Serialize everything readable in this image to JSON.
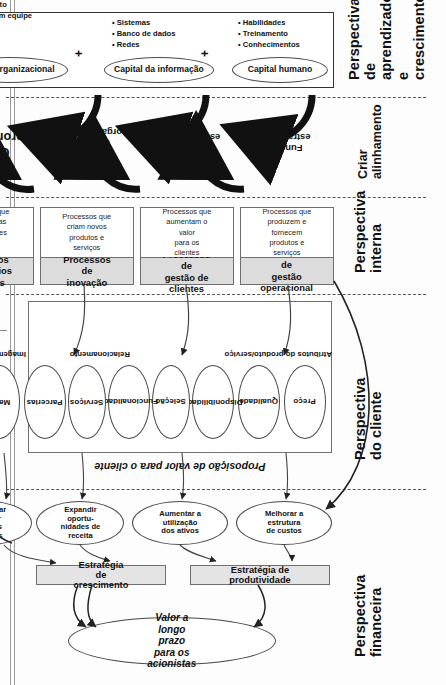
{
  "document": {
    "type": "balanced-scorecard-strategy-map",
    "language": "pt-BR"
  },
  "perspectives": [
    {
      "id": "financeira",
      "label": "Perspectiva\nfinanceira",
      "line1": "Perspectiva",
      "line2": "financeira"
    },
    {
      "id": "cliente",
      "label": "Perspectiva do cliente",
      "line1": "Perspectiva",
      "line2": "do cliente"
    },
    {
      "id": "interna",
      "label": "Perspectiva interna",
      "line1": "Perspectiva",
      "line2": "interna"
    },
    {
      "id": "alinhamento",
      "label": "Criar alinhamento",
      "line1": "Criar",
      "line2": "alinhamento"
    },
    {
      "id": "aprendizado",
      "label": "Perspectiva de aprendizado e crescimento",
      "line1": "Perspectiva de",
      "line2": "aprendizado",
      "line3": "e crescimento"
    }
  ],
  "financial": {
    "goal_oval": "Valor a longo prazo para os acionistas",
    "strategy_growth": "Estratégia de crescimento",
    "strategy_productivity": "Estratégia de produtividade",
    "objectives": [
      {
        "id": "melhorar-custos",
        "line1": "Melhorar a",
        "line2": "estrutura de custos"
      },
      {
        "id": "aumentar-utilizacao",
        "line1": "Aumentar a",
        "line2": "utilização dos ativos"
      },
      {
        "id": "expandir-receita",
        "line1": "Expandir oportu-",
        "line2": "nidades de receita"
      },
      {
        "id": "aumentar-valor",
        "line1": "Aumentar o valor",
        "line2": "para os clientes"
      }
    ]
  },
  "customer": {
    "title": "Proposição de valor para o cliente",
    "ovals": [
      "Preço",
      "Qualidade",
      "Disponibilidade",
      "Seleção",
      "Funcionalidade",
      "Serviços",
      "Parcerias",
      "Marca"
    ],
    "group_labels": [
      "Atributos do produto/serviço",
      "Relacionamento",
      "Imagem"
    ]
  },
  "internal": {
    "processes": [
      {
        "title_l1": "Processos de",
        "title_l2": "gestão operacional",
        "body_l1": "Processos que",
        "body_l2": "produzem e fornecem",
        "body_l3": "produtos e serviços"
      },
      {
        "title_l1": "Processos de",
        "title_l2": "gestão de clientes",
        "body_l1": "Processos que",
        "body_l2": "aumentam o valor",
        "body_l3": "para os clientes"
      },
      {
        "title_l1": "Processos",
        "title_l2": "de inovação",
        "body_l1": "Processos que",
        "body_l2": "criam novos",
        "body_l3": "produtos e serviços"
      },
      {
        "title_l1": "Processos regulatórios",
        "title_l2": "e sociais",
        "body_l1": "Processos que",
        "body_l2": "melhoram as comunidades",
        "body_l3": "e o meio ambiente"
      }
    ]
  },
  "alignment": {
    "captions": [
      {
        "id": "funcoes-estrategicas",
        "l1": "Funções",
        "l2": "estratégicas"
      },
      {
        "id": "portfolio-ti",
        "l1": "Portfólio",
        "l2": "estratégico de TI"
      },
      {
        "id": "agenda-mudancas",
        "l1": "Agenda de",
        "l2": "mudanças",
        "l3": "organizacionais"
      }
    ],
    "readiness": {
      "l1": "Criar",
      "l2": "prontidão"
    }
  },
  "learning": {
    "capitals": [
      {
        "id": "capital-humano",
        "label": "Capital humano",
        "bullets": [
          "Habilidades",
          "Treinamento",
          "Conhecimentos"
        ]
      },
      {
        "id": "capital-informacao",
        "label": "Capital da informação",
        "bullets": [
          "Sistemas",
          "Banco de dados",
          "Redes"
        ]
      },
      {
        "id": "capital-organizacional",
        "label": "Capital organizacional",
        "bullets": [
          "Cultura",
          "Liderança",
          "Alinhamento",
          "Trabalho em equipe"
        ]
      }
    ],
    "plus_sign": "+"
  },
  "colors": {
    "gray_box": "#e4e4e4",
    "proc_header": "#dcdcdc",
    "line": "#333333",
    "text": "#111111"
  }
}
